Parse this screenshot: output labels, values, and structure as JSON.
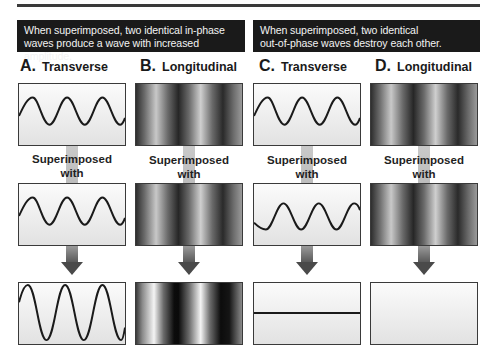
{
  "banners": {
    "left": {
      "line1": "When  superimposed, two identical in-phase",
      "line2": "waves produce a wave with increased amplitude."
    },
    "right": {
      "line1": "When  superimposed, two identical",
      "line2": "out-of-phase waves destroy each other."
    }
  },
  "columns": [
    {
      "letter": "A.",
      "name": "Transverse",
      "type": "transverse",
      "result": "increased-amplitude"
    },
    {
      "letter": "B.",
      "name": "Longitudinal",
      "type": "longitudinal",
      "result": "increased-amplitude"
    },
    {
      "letter": "C.",
      "name": "Transverse",
      "type": "transverse",
      "result": "cancelled"
    },
    {
      "letter": "D.",
      "name": "Longitudinal",
      "type": "longitudinal",
      "result": "cancelled"
    }
  ],
  "superimposed_label": {
    "line1": "Superimposed",
    "line2": "with"
  },
  "colors": {
    "banner_bg": "#1a1a1a",
    "banner_text": "#f2f2f2",
    "wave_stroke": "#1a1a1a",
    "box_border": "#3a3a3a"
  }
}
